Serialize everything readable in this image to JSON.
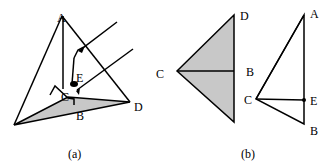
{
  "figure": {
    "panel_a": {
      "caption": "(a)",
      "labels": {
        "A": "A",
        "B": "B",
        "C": "C",
        "D": "D",
        "E": "E"
      }
    },
    "panel_b": {
      "caption": "(b)",
      "left_labels": {
        "C": "C",
        "D": "D",
        "B": "B"
      },
      "right_labels": {
        "A": "A",
        "C": "C",
        "E": "E",
        "B": "B"
      }
    },
    "colors": {
      "stroke": "#000000",
      "fill": "#c8c8c8",
      "background": "#ffffff"
    }
  }
}
